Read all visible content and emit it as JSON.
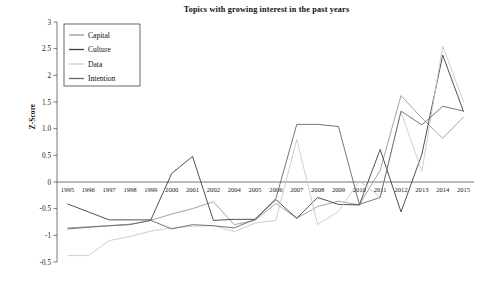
{
  "chart_data": {
    "type": "line",
    "title": "Topics with growing interest in the past years",
    "xlabel": "",
    "ylabel": "Z-Score",
    "grid": false,
    "legend_position": "top-left-inside",
    "ylim": [
      -1.5,
      3
    ],
    "ytick_labels": [
      "3",
      "2.5",
      "2",
      "1.5",
      "1.0",
      "0.5",
      "0",
      "-0.5",
      "-1",
      "-0.5"
    ],
    "ytick_values": [
      3,
      2.5,
      2,
      1.5,
      1.0,
      0.5,
      0,
      -0.5,
      -1,
      -1.5
    ],
    "categories": [
      "1995",
      "1996",
      "1997",
      "1998",
      "1999",
      "2000",
      "2001",
      "2002",
      "2004",
      "2005",
      "2006",
      "2007",
      "2008",
      "2009",
      "2010",
      "2011",
      "2012",
      "2013",
      "2014",
      "2015"
    ],
    "series": [
      {
        "name": "Capital",
        "color": "#999999",
        "values": [
          -0.86,
          -0.84,
          -0.82,
          -0.79,
          -0.72,
          -0.6,
          -0.5,
          -0.37,
          -0.8,
          -0.72,
          -0.4,
          -0.68,
          -0.46,
          -0.36,
          -0.43,
          0.22,
          1.62,
          1.2,
          0.82,
          1.22
        ]
      },
      {
        "name": "Culture",
        "color": "#3d3d3d",
        "values": [
          -0.41,
          -0.56,
          -0.71,
          -0.71,
          -0.71,
          0.16,
          0.48,
          -0.72,
          -0.7,
          -0.7,
          -0.33,
          -0.68,
          -0.29,
          -0.42,
          -0.43,
          0.61,
          -0.56,
          0.52,
          2.38,
          1.32
        ]
      },
      {
        "name": "Data",
        "color": "#c9c9c9",
        "values": [
          -1.38,
          -1.38,
          -1.1,
          -1.02,
          -0.92,
          -0.86,
          -0.83,
          -0.82,
          -0.93,
          -0.77,
          -0.72,
          0.8,
          -0.8,
          -0.55,
          0.02,
          -0.28,
          1.31,
          0.2,
          2.55,
          1.5
        ]
      },
      {
        "name": "Intention",
        "color": "#666666",
        "values": [
          -0.88,
          -0.85,
          -0.82,
          -0.8,
          -0.72,
          -0.88,
          -0.8,
          -0.82,
          -0.86,
          -0.7,
          -0.31,
          1.08,
          1.08,
          1.04,
          -0.42,
          -0.29,
          1.33,
          1.07,
          1.42,
          1.33
        ]
      }
    ]
  },
  "legend": {
    "entries": [
      {
        "label": "Capital"
      },
      {
        "label": "Culture"
      },
      {
        "label": "Data"
      },
      {
        "label": "Intention"
      }
    ]
  }
}
